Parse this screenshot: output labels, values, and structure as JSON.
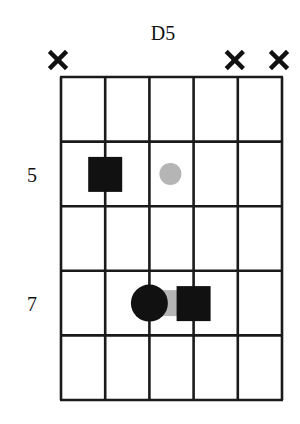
{
  "chord": {
    "name": "D5",
    "strings": 6,
    "frets_shown": 5,
    "string_status": [
      "x",
      "",
      "",
      "",
      "x",
      "x"
    ],
    "fret_labels": [
      {
        "row": 2,
        "label": "5"
      },
      {
        "row": 4,
        "label": "7"
      }
    ],
    "markers": [
      {
        "string": 2,
        "row": 2,
        "shape": "square",
        "color": "#111111"
      },
      {
        "string": 3,
        "row": 2,
        "shape": "dot-small",
        "color": "#b5b5b5"
      },
      {
        "string": 3,
        "row": 4,
        "shape": "circle",
        "color": "#111111"
      },
      {
        "string": 4,
        "row": 4,
        "shape": "square",
        "color": "#111111"
      }
    ],
    "connector": {
      "from_string": 3,
      "to_string": 4,
      "row": 4,
      "color": "#b5b5b5"
    },
    "colors": {
      "line": "#1a1a1a",
      "mute": "#111111"
    }
  }
}
